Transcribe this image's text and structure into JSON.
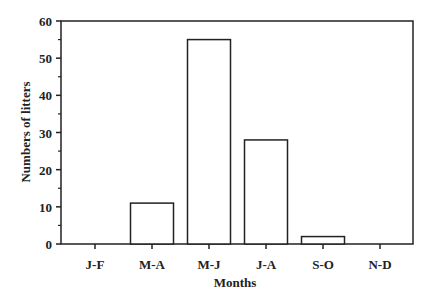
{
  "chart_data": {
    "type": "bar",
    "title": "",
    "xlabel": "Months",
    "ylabel": "Numbers of litters",
    "categories": [
      "J-F",
      "M-A",
      "M-J",
      "J-A",
      "S-O",
      "N-D"
    ],
    "values": [
      0,
      11,
      55,
      28,
      2,
      0
    ],
    "ylim": [
      0,
      60
    ],
    "yticks": [
      0,
      10,
      20,
      30,
      40,
      50,
      60
    ],
    "grid": false,
    "legend": null,
    "bar_fill": "#ffffff",
    "bar_stroke": "#222222"
  }
}
